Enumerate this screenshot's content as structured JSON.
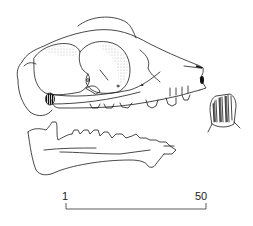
{
  "figure": {
    "parts": [
      "cranium",
      "mandible",
      "incisor-detail"
    ],
    "line_color": "#1a1a1a",
    "background": "#ffffff"
  },
  "scale_bar": {
    "start_label": "1",
    "end_label": "50"
  }
}
